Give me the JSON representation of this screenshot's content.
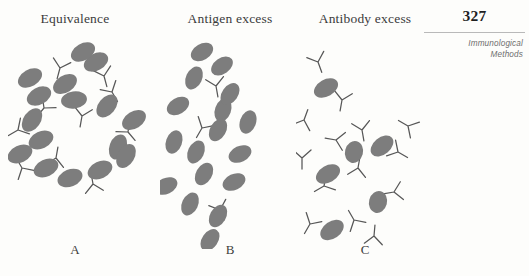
{
  "page": {
    "number": "327",
    "running_head_line1": "Immunological",
    "running_head_line2": "Methods",
    "background_color": "#fdfdfb"
  },
  "colors": {
    "antigen_fill": "#7d7d7d",
    "antibody_stroke": "#575757",
    "title_text": "#3b3b3b",
    "rule": "#b9b9b9"
  },
  "panels": [
    {
      "id": "A",
      "letter": "A",
      "title": "Equivalence",
      "antigen_count": 16,
      "antibody_count": 10,
      "description": "Large cross-linked lattice of antigens and antibodies"
    },
    {
      "id": "B",
      "letter": "B",
      "title": "Antigen excess",
      "antigen_count": 17,
      "antibody_count": 3,
      "description": "Many free antigens, few small complexes"
    },
    {
      "id": "C",
      "letter": "C",
      "title": "Antibody excess",
      "antigen_count": 6,
      "antibody_count": 14,
      "description": "Many free antibodies, few antigens, small complexes"
    }
  ],
  "figure_shapes": {
    "panel_a": {
      "antigens": [
        {
          "cx": 88,
          "cy": 28,
          "rx": 13,
          "ry": 8.5,
          "rot": -28
        },
        {
          "cx": 57,
          "cy": 50,
          "rx": 13,
          "ry": 8.5,
          "rot": -32
        },
        {
          "cx": 22,
          "cy": 44,
          "rx": 13,
          "ry": 8.5,
          "rot": -30
        },
        {
          "cx": 31,
          "cy": 62,
          "rx": 13,
          "ry": 8.5,
          "rot": -28
        },
        {
          "cx": 66,
          "cy": 66,
          "rx": 13,
          "ry": 8.5,
          "rot": -8
        },
        {
          "cx": 99,
          "cy": 72,
          "rx": 13,
          "ry": 8.5,
          "rot": -50
        },
        {
          "cx": 24,
          "cy": 86,
          "rx": 13,
          "ry": 8.5,
          "rot": -55
        },
        {
          "cx": 33,
          "cy": 106,
          "rx": 13,
          "ry": 8.5,
          "rot": -25
        },
        {
          "cx": 126,
          "cy": 86,
          "rx": 13,
          "ry": 8.5,
          "rot": -32
        },
        {
          "cx": 12,
          "cy": 120,
          "rx": 13,
          "ry": 8.5,
          "rot": -25
        },
        {
          "cx": 110,
          "cy": 113,
          "rx": 13,
          "ry": 8.5,
          "rot": -70
        },
        {
          "cx": 38,
          "cy": 134,
          "rx": 13,
          "ry": 8.5,
          "rot": -25
        },
        {
          "cx": 62,
          "cy": 144,
          "rx": 13,
          "ry": 8.5,
          "rot": -22
        },
        {
          "cx": 92,
          "cy": 136,
          "rx": 13,
          "ry": 8.5,
          "rot": -25
        },
        {
          "cx": 118,
          "cy": 122,
          "rx": 13,
          "ry": 8.5,
          "rot": -60
        },
        {
          "cx": 75,
          "cy": 18,
          "rx": 13,
          "ry": 8.5,
          "rot": -30
        }
      ],
      "antibodies": [
        {
          "x": 52,
          "y": 34,
          "rot": 15
        },
        {
          "x": 96,
          "y": 42,
          "rot": -15
        },
        {
          "x": 36,
          "y": 74,
          "rot": 40
        },
        {
          "x": 74,
          "y": 82,
          "rot": 10
        },
        {
          "x": 104,
          "y": 58,
          "rot": -30
        },
        {
          "x": 10,
          "y": 96,
          "rot": 60
        },
        {
          "x": 120,
          "y": 98,
          "rot": -40
        },
        {
          "x": 48,
          "y": 124,
          "rot": 190
        },
        {
          "x": 85,
          "y": 150,
          "rot": 170
        },
        {
          "x": 14,
          "y": 134,
          "rot": 150
        }
      ]
    },
    "panel_b": {
      "antigens": [
        {
          "cx": 42,
          "cy": 18,
          "rx": 12,
          "ry": 8,
          "rot": -30
        },
        {
          "cx": 62,
          "cy": 32,
          "rx": 12,
          "ry": 8,
          "rot": -35
        },
        {
          "cx": 34,
          "cy": 44,
          "rx": 12,
          "ry": 8,
          "rot": -65
        },
        {
          "cx": 18,
          "cy": 72,
          "rx": 12,
          "ry": 8,
          "rot": -30
        },
        {
          "cx": 63,
          "cy": 76,
          "rx": 12,
          "ry": 8,
          "rot": -70
        },
        {
          "cx": 58,
          "cy": 96,
          "rx": 12,
          "ry": 8,
          "rot": -60
        },
        {
          "cx": 88,
          "cy": 88,
          "rx": 12,
          "ry": 8,
          "rot": -70
        },
        {
          "cx": 14,
          "cy": 108,
          "rx": 12,
          "ry": 8,
          "rot": -70
        },
        {
          "cx": 36,
          "cy": 118,
          "rx": 12,
          "ry": 8,
          "rot": -65
        },
        {
          "cx": 44,
          "cy": 140,
          "rx": 12,
          "ry": 8,
          "rot": -60
        },
        {
          "cx": 74,
          "cy": 148,
          "rx": 12,
          "ry": 8,
          "rot": -25
        },
        {
          "cx": 6,
          "cy": 152,
          "rx": 12,
          "ry": 8,
          "rot": -25
        },
        {
          "cx": 30,
          "cy": 170,
          "rx": 12,
          "ry": 8,
          "rot": -65
        },
        {
          "cx": 58,
          "cy": 182,
          "rx": 12,
          "ry": 8,
          "rot": -60
        },
        {
          "cx": 50,
          "cy": 206,
          "rx": 12,
          "ry": 8,
          "rot": -55
        },
        {
          "cx": 80,
          "cy": 120,
          "rx": 12,
          "ry": 8,
          "rot": -25
        },
        {
          "cx": 70,
          "cy": 60,
          "rx": 12,
          "ry": 8,
          "rot": -55
        }
      ],
      "antibodies": [
        {
          "x": 56,
          "y": 52,
          "rot": -10
        },
        {
          "x": 42,
          "y": 94,
          "rot": 30
        },
        {
          "x": 60,
          "y": 176,
          "rot": -20
        }
      ]
    },
    "panel_c": {
      "antigens": [
        {
          "cx": 30,
          "cy": 54,
          "rx": 13,
          "ry": 8.5,
          "rot": -30
        },
        {
          "cx": 86,
          "cy": 112,
          "rx": 13,
          "ry": 8.5,
          "rot": -40
        },
        {
          "cx": 32,
          "cy": 140,
          "rx": 13,
          "ry": 8.5,
          "rot": -30
        },
        {
          "cx": 82,
          "cy": 168,
          "rx": 11,
          "ry": 9,
          "rot": -75
        },
        {
          "cx": 36,
          "cy": 196,
          "rx": 13,
          "ry": 8.5,
          "rot": -35
        },
        {
          "cx": 58,
          "cy": 118,
          "rx": 11,
          "ry": 9,
          "rot": -75
        }
      ],
      "antibodies": [
        {
          "x": 22,
          "y": 28,
          "rot": -20
        },
        {
          "x": 46,
          "y": 66,
          "rot": 10
        },
        {
          "x": 66,
          "y": 96,
          "rot": -10
        },
        {
          "x": 40,
          "y": 106,
          "rot": 100
        },
        {
          "x": 102,
          "y": 118,
          "rot": -60
        },
        {
          "x": 6,
          "y": 124,
          "rot": 0
        },
        {
          "x": 62,
          "y": 134,
          "rot": 190
        },
        {
          "x": 28,
          "y": 152,
          "rot": 60
        },
        {
          "x": 98,
          "y": 158,
          "rot": 80
        },
        {
          "x": 58,
          "y": 186,
          "rot": 150
        },
        {
          "x": 14,
          "y": 190,
          "rot": 30
        },
        {
          "x": 78,
          "y": 202,
          "rot": 185
        },
        {
          "x": 112,
          "y": 92,
          "rot": 120
        },
        {
          "x": 8,
          "y": 86,
          "rot": 200
        }
      ]
    }
  }
}
